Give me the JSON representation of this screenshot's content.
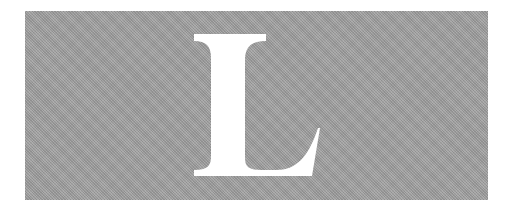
{
  "figure": {
    "letter": "L",
    "background_color": "#a4a4a4",
    "letter_color": "#ffffff"
  }
}
